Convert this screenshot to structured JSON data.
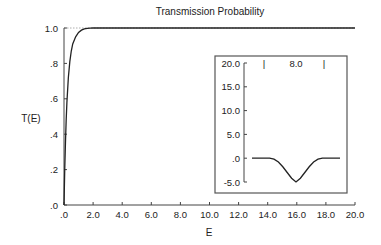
{
  "chart_data": [
    {
      "type": "line",
      "title": "Transmission Probability",
      "xlabel": "E",
      "ylabel": "T(E)",
      "xlim": [
        0,
        20
      ],
      "ylim": [
        0,
        1.0
      ],
      "x_ticks": [
        0,
        2,
        4,
        6,
        8,
        10,
        12,
        14,
        16,
        18,
        20
      ],
      "x_tick_labels": [
        ".0",
        "2.0",
        "4.0",
        "6.0",
        "8.0",
        "10.0",
        "12.0",
        "14.0",
        "16.0",
        "18.0",
        "20.0"
      ],
      "y_ticks": [
        0,
        0.2,
        0.4,
        0.6,
        0.8,
        1.0
      ],
      "y_tick_labels": [
        ".0",
        ".2",
        ".4",
        ".6",
        ".8",
        "1.0"
      ],
      "grid": false,
      "reference_line": {
        "y": 1.0,
        "style": "dotted"
      },
      "series": [
        {
          "name": "T(E)",
          "x": [
            0.0,
            0.05,
            0.1,
            0.15,
            0.2,
            0.3,
            0.4,
            0.5,
            0.6,
            0.8,
            1.0,
            1.2,
            1.4,
            1.6,
            1.8,
            2.0,
            2.5,
            3.0,
            5.0,
            10.0,
            15.0,
            20.0
          ],
          "y": [
            0.0,
            0.2,
            0.35,
            0.48,
            0.58,
            0.72,
            0.81,
            0.87,
            0.91,
            0.95,
            0.975,
            0.988,
            0.995,
            0.998,
            0.999,
            1.0,
            1.0,
            1.0,
            1.0,
            1.0,
            1.0,
            1.0
          ]
        }
      ]
    },
    {
      "type": "line",
      "title": "",
      "placement": "inset lower-right",
      "ylim": [
        -5.0,
        20.0
      ],
      "y_ticks": [
        -5,
        0,
        5,
        10,
        15,
        20
      ],
      "y_tick_labels": [
        "-5.0",
        ".0",
        "5.0",
        "10.0",
        "15.0",
        "20.0"
      ],
      "annotation": "8.0",
      "width_marker_labels": [
        "|",
        "|"
      ],
      "xlim": [
        0,
        1
      ],
      "series": [
        {
          "name": "potential",
          "x": [
            0.0,
            0.2,
            0.25,
            0.3,
            0.35,
            0.4,
            0.45,
            0.5,
            0.55,
            0.6,
            0.65,
            0.7,
            0.75,
            0.8,
            1.0
          ],
          "y": [
            0.0,
            0.0,
            -0.2,
            -0.8,
            -1.8,
            -3.0,
            -4.2,
            -5.0,
            -4.2,
            -3.0,
            -1.8,
            -0.8,
            -0.2,
            0.0,
            0.0
          ]
        }
      ]
    }
  ]
}
